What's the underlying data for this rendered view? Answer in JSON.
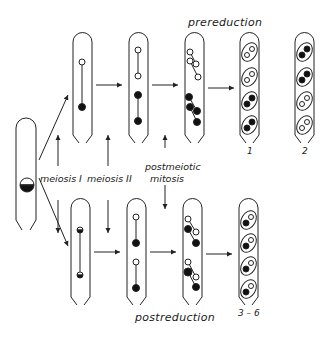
{
  "diagram": {
    "title_top": "prereduction",
    "title_bottom": "postreduction",
    "stage_labels": {
      "meiosis_1": "meiosis  I",
      "meiosis_2": "meiosis  II",
      "postmeiotic_line1": "postmeiotic",
      "postmeiotic_line2": "mitosis"
    },
    "ascus_labels": {
      "prereduction_1": "1",
      "prereduction_2": "2",
      "postreduction": "3 – 6"
    },
    "nodes": [
      {
        "id": "zygote",
        "content": "half black / half white nucleus"
      },
      {
        "id": "pre-meiosis-I",
        "content": "white top, black bottom (one spindle)"
      },
      {
        "id": "pre-meiosis-II",
        "content": "white, white, black, black (two spindles)"
      },
      {
        "id": "pre-mitosis",
        "content": "4 white pairs top, 4 black pairs bottom"
      },
      {
        "id": "ascus-1",
        "content": "spore pairs: white, white, black, black"
      },
      {
        "id": "ascus-2",
        "content": "spore pairs: black, black, white, white"
      },
      {
        "id": "post-meiosis-I",
        "content": "two half-black nuclei"
      },
      {
        "id": "post-meiosis-II",
        "content": "white, black, white, black"
      },
      {
        "id": "post-mitosis",
        "content": "alternating white/black pairs"
      },
      {
        "id": "ascus-3-6",
        "content": "each spore pair: one white, one black"
      }
    ]
  }
}
